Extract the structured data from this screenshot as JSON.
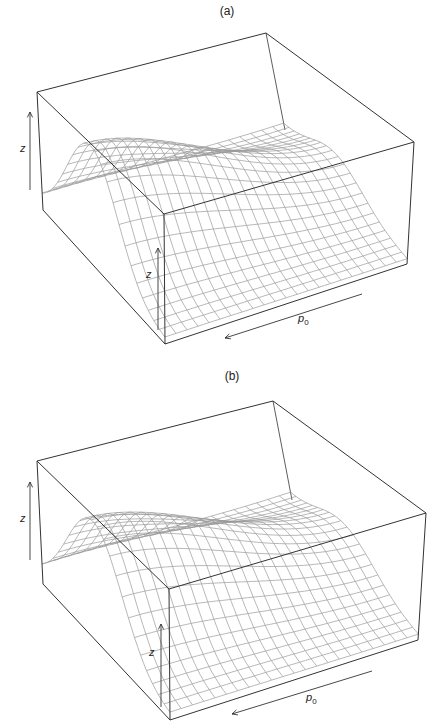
{
  "chart_data": [
    {
      "type": "surface3d",
      "title": "(a)",
      "xlabel": "p0",
      "xlabel_main": "p",
      "xlabel_sub": "0",
      "zlabel": "z",
      "zlabel_inner": "z",
      "grid": false,
      "description": "Perspective wireframe surface: ridge (bell-shaped across one axis) whose height decreases along p0",
      "surface": {
        "grid_n": 22,
        "ridge_center": 0.42,
        "ridge_width": 0.2,
        "peak_height": 0.98,
        "decay_along_p0": 0.7,
        "floor": 0.04
      },
      "layout": {
        "title_pos": [
          227,
          4
        ],
        "box": {
          "base": {
            "L": [
              43,
              210
            ],
            "F": [
              165,
              344
            ],
            "R": [
              407,
              264
            ],
            "B": [
              285,
              130
            ]
          },
          "top": {
            "L": [
              37,
              92
            ],
            "F": [
              164,
              214
            ],
            "R": [
              414,
              142
            ],
            "B": [
              266,
              33
            ]
          }
        },
        "z_arrow_outer": {
          "x": 30,
          "y1": 190,
          "y2": 112,
          "label_pos": [
            20,
            142
          ]
        },
        "z_arrow_inner": {
          "x": 158,
          "y1": 330,
          "y2": 248,
          "label_pos": [
            146,
            268
          ]
        },
        "p0_arrow": {
          "from": [
            362,
            294
          ],
          "to": [
            225,
            338
          ],
          "label_pos": [
            298,
            312
          ]
        }
      }
    },
    {
      "type": "surface3d",
      "title": "(b)",
      "xlabel": "p0",
      "xlabel_main": "p",
      "xlabel_sub": "0",
      "zlabel": "z",
      "zlabel_inner": "z",
      "grid": false,
      "description": "Perspective wireframe surface: ridge (bell-shaped across one axis) whose height decreases along p0",
      "surface": {
        "grid_n": 22,
        "ridge_center": 0.42,
        "ridge_width": 0.21,
        "peak_height": 0.95,
        "decay_along_p0": 0.68,
        "floor": 0.04
      },
      "layout": {
        "title_pos": [
          232,
          369
        ],
        "box": {
          "base": {
            "L": [
              43,
              584
            ],
            "F": [
              170,
              720
            ],
            "R": [
              418,
              640
            ],
            "B": [
              292,
              500
            ]
          },
          "top": {
            "L": [
              37,
              461
            ],
            "F": [
              169,
              589
            ],
            "R": [
              426,
              513
            ],
            "B": [
              273,
              401
            ]
          }
        },
        "z_arrow_outer": {
          "x": 30,
          "y1": 560,
          "y2": 482,
          "label_pos": [
            20,
            512
          ]
        },
        "z_arrow_inner": {
          "x": 161,
          "y1": 707,
          "y2": 624,
          "label_pos": [
            149,
            646
          ]
        },
        "p0_arrow": {
          "from": [
            372,
            671
          ],
          "to": [
            232,
            714
          ],
          "label_pos": [
            306,
            691
          ]
        }
      }
    }
  ],
  "colors": {
    "box": "#333333",
    "mesh": "#9a9a9a",
    "text": "#222222"
  }
}
